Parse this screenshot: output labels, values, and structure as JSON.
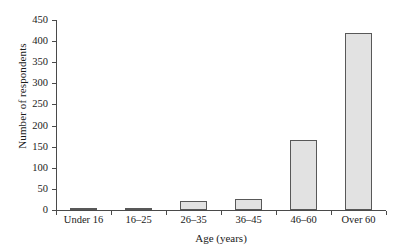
{
  "chart_data": {
    "type": "bar",
    "title": "",
    "subtitle": "",
    "xlabel": "Age (years)",
    "ylabel": "Number of respondents",
    "categories": [
      "Under 16",
      "16–25",
      "26–35",
      "36–45",
      "46–60",
      "Over 60"
    ],
    "values": [
      2,
      3,
      21,
      27,
      165,
      420
    ],
    "ylim": [
      0,
      450
    ],
    "yticks": [
      0,
      50,
      100,
      150,
      200,
      250,
      300,
      350,
      400,
      450
    ],
    "ytick_labels": [
      "0",
      "50",
      "100",
      "150",
      "200",
      "250",
      "300",
      "350",
      "400",
      "450"
    ],
    "grid": false,
    "legend": null,
    "legend_position": "none",
    "bar_fill_color": "#e2e2e2",
    "bar_edge_color": "#585858",
    "axis_color": "#4a4a4a",
    "text_color": "#1a1a1a",
    "background_color": "#ffffff",
    "tick_position": "category-boundaries",
    "series": [
      {
        "name": "Number of respondents",
        "values": [
          2,
          3,
          21,
          27,
          165,
          420
        ]
      }
    ]
  }
}
